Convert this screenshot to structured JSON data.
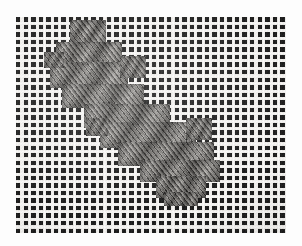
{
  "image": {
    "title": "Needlepoint canvas with diagonal stitched band",
    "subject": "needlepoint-canvas-swatch",
    "medium": "black and white photograph",
    "palette": {
      "paper_background": "#ffffff",
      "canvas_light_thread": "#eceae6",
      "canvas_hole_dark": "#191919",
      "stitch_midtone": "#8d8a85",
      "stitch_shadow": "#262422",
      "stitch_highlight": "#afaca6"
    },
    "canvas": {
      "label": "open mesh canvas ground",
      "left": 16,
      "top": 17,
      "width": 270,
      "height": 216,
      "mesh_period_px": 7.55,
      "hole_size_px": 4.4,
      "description": "regular square grid of dark mesh openings between pale woven threads"
    },
    "stitching": {
      "label": "diagonal tent-stitch band",
      "direction": "upper-left to lower-right",
      "stitch_angle_label": "diagonal / slanted",
      "edge_style": "stepped staircase",
      "blocks": [
        {
          "name": "block-top",
          "left": 70,
          "top": 20,
          "width": 36,
          "height": 26
        },
        {
          "name": "block-top-wide",
          "left": 56,
          "top": 42,
          "width": 66,
          "height": 24
        },
        {
          "name": "block-upper",
          "left": 50,
          "top": 62,
          "width": 78,
          "height": 26
        },
        {
          "name": "block-upper-mid",
          "left": 62,
          "top": 84,
          "width": 82,
          "height": 24
        },
        {
          "name": "block-mid-hi",
          "left": 84,
          "top": 104,
          "width": 86,
          "height": 24
        },
        {
          "name": "block-mid",
          "left": 100,
          "top": 122,
          "width": 96,
          "height": 26
        },
        {
          "name": "block-mid-low",
          "left": 118,
          "top": 142,
          "width": 96,
          "height": 24
        },
        {
          "name": "block-lower",
          "left": 140,
          "top": 160,
          "width": 80,
          "height": 22
        },
        {
          "name": "block-bottom",
          "left": 156,
          "top": 176,
          "width": 50,
          "height": 22
        },
        {
          "name": "block-tail",
          "left": 164,
          "top": 192,
          "width": 34,
          "height": 14
        },
        {
          "name": "spur-upper-right",
          "left": 120,
          "top": 56,
          "width": 26,
          "height": 22
        },
        {
          "name": "spur-lower-left",
          "left": 86,
          "top": 118,
          "width": 22,
          "height": 18
        },
        {
          "name": "spur-right",
          "left": 186,
          "top": 118,
          "width": 26,
          "height": 22
        },
        {
          "name": "spur-left-notch",
          "left": 44,
          "top": 52,
          "width": 20,
          "height": 16
        }
      ]
    }
  }
}
